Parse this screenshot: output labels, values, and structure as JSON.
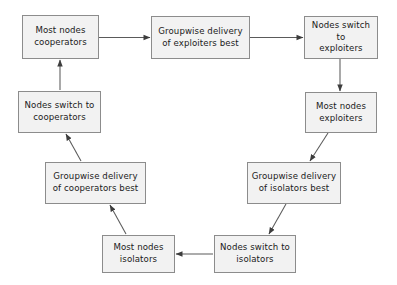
{
  "diagram": {
    "background_color": "#ffffff",
    "node_fill_color": "#f2f2f2",
    "node_border_color": "#8c8c8c",
    "edge_color": "#4d4d4d",
    "text_color": "#1a1a1a",
    "nodes": [
      {
        "id": "most-nodes-cooperators",
        "label": "Most nodes\ncooperators",
        "x": 22,
        "y": 15,
        "w": 77,
        "h": 44
      },
      {
        "id": "groupwise-delivery-exploiters-best",
        "label": "Groupwise delivery\nof exploiters best",
        "x": 151,
        "y": 16,
        "w": 99,
        "h": 43
      },
      {
        "id": "nodes-switch-to-exploiters",
        "label": "Nodes switch to\nexploiters",
        "x": 304,
        "y": 16,
        "w": 74,
        "h": 43
      },
      {
        "id": "most-nodes-exploiters",
        "label": "Most nodes\nexploiters",
        "x": 305,
        "y": 92,
        "w": 72,
        "h": 41
      },
      {
        "id": "groupwise-delivery-isolators-best",
        "label": "Groupwise delivery\nof isolators best",
        "x": 247,
        "y": 162,
        "w": 94,
        "h": 42
      },
      {
        "id": "nodes-switch-to-isolators",
        "label": "Nodes switch to\nisolators",
        "x": 214,
        "y": 235,
        "w": 82,
        "h": 38
      },
      {
        "id": "most-nodes-isolators",
        "label": "Most nodes\nisolators",
        "x": 102,
        "y": 235,
        "w": 73,
        "h": 38
      },
      {
        "id": "groupwise-delivery-cooperators-best",
        "label": "Groupwise delivery\nof cooperators best",
        "x": 45,
        "y": 162,
        "w": 101,
        "h": 42
      },
      {
        "id": "nodes-switch-to-cooperators",
        "label": "Nodes switch to\ncooperators",
        "x": 18,
        "y": 91,
        "w": 83,
        "h": 42
      }
    ],
    "edges": [
      {
        "id": "edge-cooperators-to-groupwise-exploiters",
        "from": "most-nodes-cooperators",
        "to": "groupwise-delivery-exploiters-best",
        "kind": "horizontal-right"
      },
      {
        "id": "edge-groupwise-exploiters-to-switch-exploiters",
        "from": "groupwise-delivery-exploiters-best",
        "to": "nodes-switch-to-exploiters",
        "kind": "horizontal-right"
      },
      {
        "id": "edge-switch-exploiters-to-most-exploiters",
        "from": "nodes-switch-to-exploiters",
        "to": "most-nodes-exploiters",
        "kind": "vertical-down"
      },
      {
        "id": "edge-most-exploiters-to-groupwise-isolators",
        "from": "most-nodes-exploiters",
        "to": "groupwise-delivery-isolators-best",
        "kind": "diagonal-down-left"
      },
      {
        "id": "edge-groupwise-isolators-to-switch-isolators",
        "from": "groupwise-delivery-isolators-best",
        "to": "nodes-switch-to-isolators",
        "kind": "diagonal-down-left"
      },
      {
        "id": "edge-switch-isolators-to-most-isolators",
        "from": "nodes-switch-to-isolators",
        "to": "most-nodes-isolators",
        "kind": "horizontal-left"
      },
      {
        "id": "edge-most-isolators-to-groupwise-cooperators",
        "from": "most-nodes-isolators",
        "to": "groupwise-delivery-cooperators-best",
        "kind": "diagonal-up-left"
      },
      {
        "id": "edge-groupwise-cooperators-to-switch-cooperators",
        "from": "groupwise-delivery-cooperators-best",
        "to": "nodes-switch-to-cooperators",
        "kind": "diagonal-up-left"
      },
      {
        "id": "edge-switch-cooperators-to-most-cooperators",
        "from": "nodes-switch-to-cooperators",
        "to": "most-nodes-cooperators",
        "kind": "vertical-up"
      }
    ]
  }
}
